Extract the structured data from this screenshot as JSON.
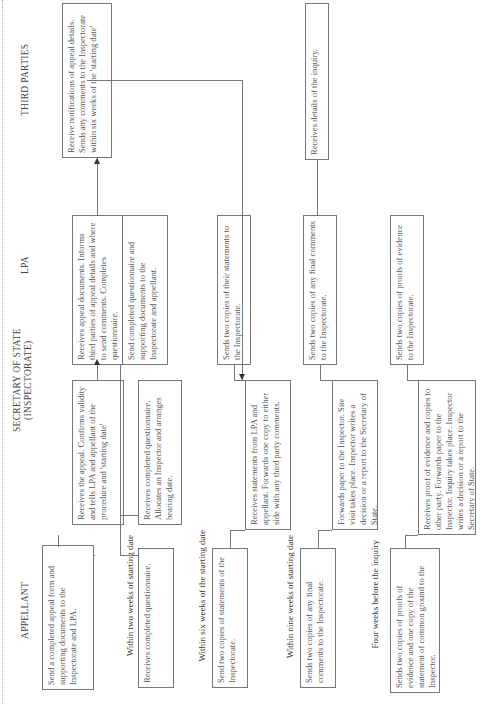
{
  "headers": {
    "appellant": "APPELLANT",
    "secretary": "SECRETARY OF STATE (INSPECTORATE)",
    "lpa": "LPA",
    "third_parties": "THIRD PARTIES"
  },
  "time_labels": {
    "two_weeks": "Within two weeks of starting date",
    "six_weeks": "Within six weeks of the starting date",
    "nine_weeks": "Within nine weeks of starting date",
    "four_weeks_inquiry": "Four weeks before the inquiry"
  },
  "boxes": {
    "appellant_send_form": "Send a completed appeal form and supporting documents to the Inspectorate and LPA.",
    "sos_receives_appeal": "Receives the appeal. Confirms validity and tells LPA and appellant of the procedure and 'starting date'",
    "lpa_receives_docs": "Receives appeal documents. Informs third parties of appeal details and where to send comments. Completes questionnaire.",
    "third_receive_notifications": "Receive notifications of appeal details. Sends any comments to the Inspectorate within six weeks of the 'starting date'",
    "lpa_send_questionnaire": "Send completed questionnaire and supporting documents to the Inspectorate and appellant.",
    "appellant_receives_questionnaire": "Receives completed questionnaire.",
    "sos_receives_questionnaire": "Receives completed questionnaire. Allocates an Inspector and arranges hearing date.",
    "appellant_send_statements": "Send two copies of statements of the Inspectorate.",
    "sos_receives_statements": "Receives statements from LPA and appellant. Forwards one copy to either side with any third party comments.",
    "lpa_sends_statements": "Sends two copies of their statements to the Inspectorate.",
    "appellant_final_comments": "Sends two copies of any final comments to the Inspectorate.",
    "sos_forwards_paper": "Forwards paper to the Inspector. Site visit takes place. Inspector writes a decision or a report to the Secretary of State.",
    "lpa_final_comments": "Sends two copies of any final comments to the Inspectorate.",
    "third_receive_inquiry": "Receives details of the inquiry.",
    "appellant_proofs": "Sends two copies of proofs of evidence and one copy of the statement of common ground to the Inspector.",
    "sos_receives_proofs": "Receives proof of evidence and copies to other party. Forwards paper to the Inspector. Inquiry takes place. Inspector writes a decision or a report to the Secretary of State.",
    "lpa_proofs": "Sends two copies of proofs of evidence to the Inspectorate."
  }
}
